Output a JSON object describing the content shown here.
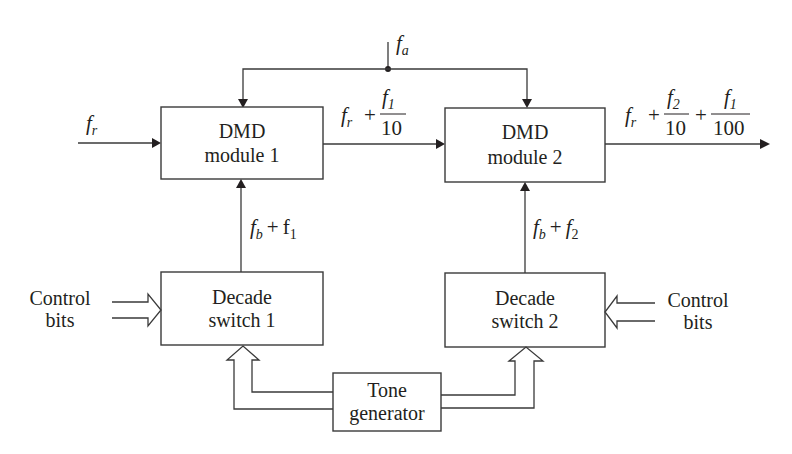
{
  "diagram": {
    "type": "block-diagram",
    "blocks": {
      "dmd1": {
        "line1": "DMD",
        "line2": "module 1"
      },
      "dmd2": {
        "line1": "DMD",
        "line2": "module 2"
      },
      "switch1": {
        "line1": "Decade",
        "line2": "switch 1"
      },
      "switch2": {
        "line1": "Decade",
        "line2": "switch 2"
      },
      "tone": {
        "line1": "Tone",
        "line2": "generator"
      }
    },
    "labels": {
      "fa": {
        "base": "f",
        "sub": "a"
      },
      "fr_in": {
        "base": "f",
        "sub": "r"
      },
      "mid_out": {
        "base": "f",
        "sub": "r",
        "plus": "+",
        "num_base": "f",
        "num_sub": "1",
        "den": "10"
      },
      "final_out": {
        "base": "f",
        "sub": "r",
        "plus1": "+",
        "num1_base": "f",
        "num1_sub": "2",
        "den1": "10",
        "plus2": "+",
        "num2_base": "f",
        "num2_sub": "1",
        "den2": "100"
      },
      "fb1": {
        "base": "f",
        "sub": "b",
        "plus": "+",
        "term": "f",
        "term_sub": "1"
      },
      "fb2": {
        "base": "f",
        "sub": "b",
        "plus": "+",
        "term": "f",
        "term_sub": "2"
      },
      "control_left": {
        "line1": "Control",
        "line2": "bits"
      },
      "control_right": {
        "line1": "Control",
        "line2": "bits"
      }
    },
    "colors": {
      "line": "#3a3a3a",
      "text": "#231f20",
      "background": "#ffffff"
    }
  }
}
